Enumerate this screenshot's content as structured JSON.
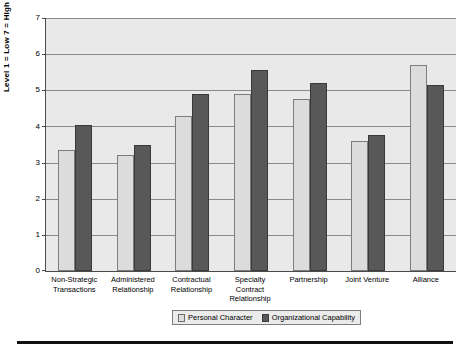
{
  "chart_data": {
    "type": "bar",
    "title": "",
    "xlabel": "",
    "ylabel": "Level 1 = Low 7 = High",
    "ylim": [
      0,
      7
    ],
    "ytick_labels": [
      "0",
      "1",
      "2",
      "3",
      "4",
      "5",
      "6",
      "7"
    ],
    "grid": true,
    "legend_position": "bottom",
    "categories": [
      "Non-Strategic Transactions",
      "Administered Relationship",
      "Contractual Relationship",
      "Specialty Contract Relationship",
      "Partnership",
      "Joint Venture",
      "Alliance"
    ],
    "series": [
      {
        "name": "Personal Character",
        "color": "#dcdcdc",
        "values": [
          3.35,
          3.2,
          4.3,
          4.9,
          4.75,
          3.6,
          5.7
        ]
      },
      {
        "name": "Organizational Capability",
        "color": "#585858",
        "values": [
          4.05,
          3.5,
          4.9,
          5.55,
          5.2,
          3.75,
          5.15
        ]
      }
    ]
  },
  "axis": {
    "y_title": "Level 1 = Low 7 = High",
    "y_ticks": [
      "7",
      "6",
      "5",
      "4",
      "3",
      "2",
      "1",
      "0"
    ]
  },
  "categories": [
    "Non-Strategic Transactions",
    "Administered Relationship",
    "Contractual Relationship",
    "Specialty Contract Relationship",
    "Partnership",
    "Joint Venture",
    "Alliance"
  ],
  "legend": {
    "items": [
      {
        "label": "Personal Character"
      },
      {
        "label": "Organizational Capability"
      }
    ]
  }
}
